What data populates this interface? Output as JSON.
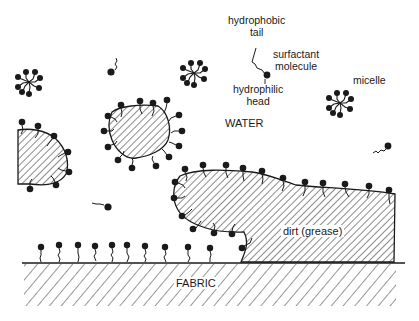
{
  "figure": {
    "labels": {
      "hydrophobic_tail_line1": "hydrophobic",
      "hydrophobic_tail_line2": "tail",
      "surfactant_line1": "surfactant",
      "surfactant_line2": "molecule",
      "hydrophilic_head_line1": "hydrophilic",
      "hydrophilic_head_line2": "head",
      "micelle": "micelle",
      "water": "WATER",
      "dirt": "dirt (grease)",
      "fabric": "FABRIC"
    },
    "colors": {
      "ink": "#1a1a1a",
      "background": "#ffffff"
    },
    "elements": {
      "micelles": 4,
      "free_surfactant_molecules": 4,
      "detached_grease_droplets": 2,
      "attached_grease_mass": 1,
      "surfactants_on_fabric": 10
    }
  }
}
